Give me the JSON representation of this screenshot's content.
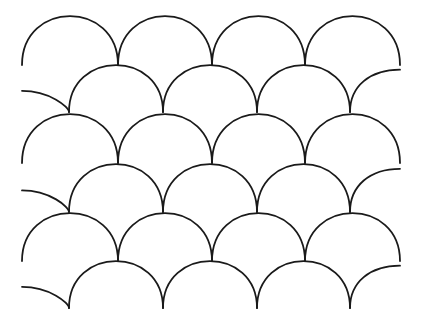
{
  "artwork": {
    "subject": "scale pattern line drawing",
    "stroke_color": "#1a1a1a",
    "background_color": "#ffffff",
    "rows": [
      {
        "cusp_y": 65,
        "top_y": 16,
        "cusps_x": [
          22,
          118,
          212,
          305,
          400
        ]
      },
      {
        "cusp_y": 112,
        "top_y": 65,
        "cusps_x": [
          22,
          69,
          163,
          257,
          350,
          400
        ]
      },
      {
        "cusp_y": 163,
        "top_y": 114,
        "cusps_x": [
          22,
          118,
          212,
          305,
          400
        ]
      },
      {
        "cusp_y": 212,
        "top_y": 164,
        "cusps_x": [
          22,
          69,
          163,
          257,
          350,
          400
        ]
      },
      {
        "cusp_y": 261,
        "top_y": 213,
        "cusps_x": [
          22,
          118,
          212,
          305,
          400
        ]
      },
      {
        "cusp_y": 308,
        "top_y": 261,
        "cusps_x": [
          22,
          69,
          163,
          257,
          350,
          400
        ]
      }
    ]
  }
}
